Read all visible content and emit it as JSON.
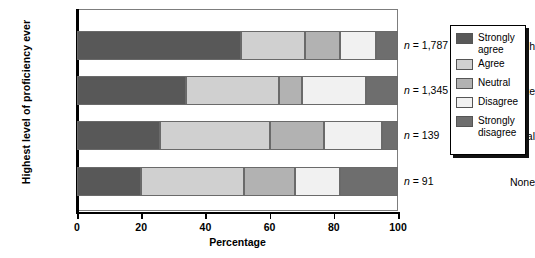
{
  "chart_data": {
    "type": "bar",
    "orientation": "horizontal",
    "stacked": true,
    "stack_mode": "percent",
    "title": "",
    "xlabel": "Percentage",
    "ylabel": "Highest level of proficiency ever",
    "xlim": [
      0,
      100
    ],
    "xticks": [
      0,
      20,
      40,
      60,
      80,
      100
    ],
    "xtick_labels": [
      "0",
      "20",
      "40",
      "60",
      "80",
      "100"
    ],
    "grid": false,
    "legend_position": "right-outside",
    "categories": [
      "High",
      "Moderate",
      "Minimal",
      "None"
    ],
    "category_annotations": [
      "n = 1,787",
      "n = 1,345",
      "n = 139",
      "n = 91"
    ],
    "series": [
      {
        "name": "Strongly agree",
        "color": "#585858",
        "values": [
          51,
          34,
          26,
          20
        ]
      },
      {
        "name": "Agree",
        "color": "#d0d0d0",
        "values": [
          20,
          29,
          34,
          32
        ]
      },
      {
        "name": "Neutral",
        "color": "#b2b2b2",
        "values": [
          11,
          7,
          17,
          16
        ]
      },
      {
        "name": "Disagree",
        "color": "#f1f1f1",
        "values": [
          11,
          20,
          18,
          14
        ]
      },
      {
        "name": "Strongly disagree",
        "color": "#6e6e6e",
        "values": [
          7,
          10,
          5,
          18
        ]
      }
    ]
  },
  "axis": {
    "y_title": "Highest level of proficiency ever",
    "x_title": "Percentage",
    "x_ticks": [
      {
        "label": "0",
        "value": 0
      },
      {
        "label": "20",
        "value": 20
      },
      {
        "label": "40",
        "value": 40
      },
      {
        "label": "60",
        "value": 60
      },
      {
        "label": "80",
        "value": 80
      },
      {
        "label": "100",
        "value": 100
      }
    ]
  },
  "rows": [
    {
      "label": "High",
      "n_label": "n = 1,787",
      "n_value": "1,787"
    },
    {
      "label": "Moderate",
      "n_label": "n = 1,345",
      "n_value": "1,345"
    },
    {
      "label": "Minimal",
      "n_label": "n = 139",
      "n_value": "139"
    },
    {
      "label": "None",
      "n_label": "n = 91",
      "n_value": "91"
    }
  ],
  "legend": {
    "items": [
      {
        "label": "Strongly\nagree",
        "color": "#585858"
      },
      {
        "label": "Agree",
        "color": "#d0d0d0"
      },
      {
        "label": "Neutral",
        "color": "#b2b2b2"
      },
      {
        "label": "Disagree",
        "color": "#f1f1f1"
      },
      {
        "label": "Strongly\ndisagree",
        "color": "#6e6e6e"
      }
    ]
  }
}
